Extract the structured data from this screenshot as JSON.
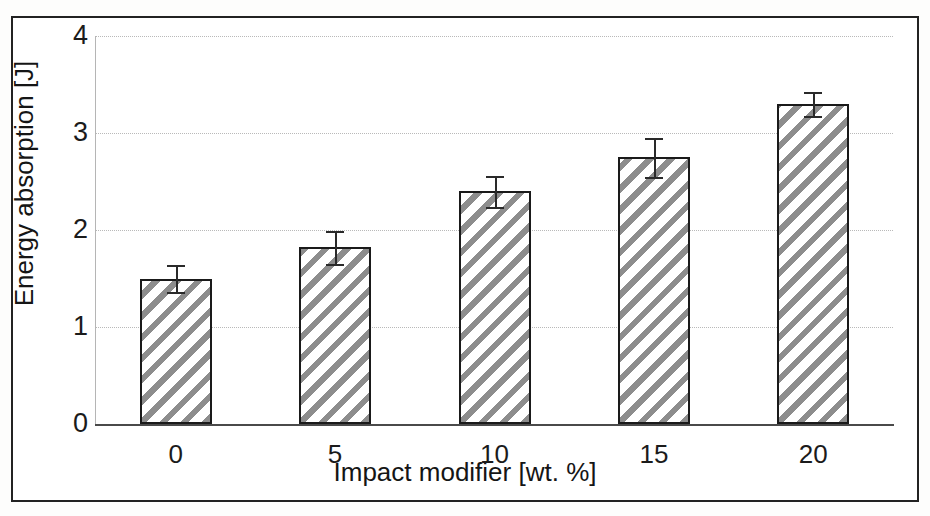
{
  "figure": {
    "background_color": "#ffffff",
    "frame_color": "#222222",
    "bar_edge_color": "#1a1a1a",
    "hatch_color": "#8d8d8d",
    "gridline_color": "#b9b9b9"
  },
  "chart_data": {
    "type": "bar",
    "title": "",
    "xlabel": "Impact modifier [wt. %]",
    "ylabel": "Energy absorption [J]",
    "categories": [
      "0",
      "5",
      "10",
      "15",
      "20"
    ],
    "values": [
      1.5,
      1.82,
      2.4,
      2.75,
      3.3
    ],
    "errors": [
      0.14,
      0.17,
      0.16,
      0.2,
      0.12
    ],
    "ylim": [
      0,
      4
    ],
    "yticks": [
      0,
      1,
      2,
      3,
      4
    ],
    "ytick_labels": [
      "0",
      "1",
      "2",
      "3",
      "4"
    ],
    "xtick_labels": [
      "0",
      "5",
      "10",
      "15",
      "20"
    ],
    "grid": "horizontal-dotted",
    "legend": "none",
    "bar_fill": "diagonal-hatch",
    "error_bar_style": "capped-vertical"
  }
}
